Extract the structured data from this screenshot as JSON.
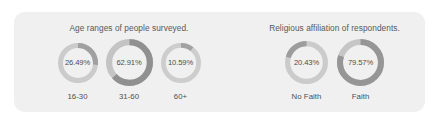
{
  "panel": {
    "background_color": "#f0f0f0",
    "corner_radius": "11px"
  },
  "theme": {
    "arc_color": "#9a9a9a",
    "track_color": "#c9c9c9",
    "title_color": "#585858",
    "label_color": "#4f4f4f",
    "value_color": "#4e4e4e",
    "page_background": "#ffffff"
  },
  "groups": [
    {
      "id": "age-ranges",
      "title": "Age ranges of people surveyed.",
      "gauges": [
        {
          "id": "age-16-30",
          "label": "16-30",
          "value_text": "26.49%",
          "value": 26.49,
          "diameter": 40,
          "thickness": 5.0,
          "start_angle": 0,
          "direction": "clockwise",
          "arc_color": "#a0a0a0",
          "track_color": "#cbcbcb"
        },
        {
          "id": "age-31-60",
          "label": "31-60",
          "value_text": "62.91%",
          "value": 62.91,
          "diameter": 47,
          "thickness": 6.2,
          "start_angle": 0,
          "direction": "clockwise",
          "arc_color": "#909090",
          "track_color": "#c4c4c4"
        },
        {
          "id": "age-60-plus",
          "label": "60+",
          "value_text": "10.59%",
          "value": 10.59,
          "diameter": 40,
          "thickness": 4.8,
          "start_angle": 0,
          "direction": "clockwise",
          "arc_color": "#a2a2a2",
          "track_color": "#cdcdcd"
        }
      ]
    },
    {
      "id": "religious-affiliation",
      "title": "Religious affiliation of respondents.",
      "gauges": [
        {
          "id": "no-faith",
          "label": "No Faith",
          "value_text": "20.43%",
          "value": 20.43,
          "diameter": 43,
          "thickness": 5.2,
          "start_angle": 0,
          "direction": "counter-clockwise",
          "arc_color": "#9d9d9d",
          "track_color": "#cbcbcb"
        },
        {
          "id": "faith",
          "label": "Faith",
          "value_text": "79.57%",
          "value": 79.57,
          "diameter": 47,
          "thickness": 6.0,
          "start_angle": 0,
          "direction": "clockwise",
          "arc_color": "#969696",
          "track_color": "#c6c6c6"
        }
      ]
    }
  ],
  "chart_data": {
    "type": "pie",
    "charts": [
      {
        "type": "pie",
        "subtype": "donut-gauge-set",
        "title": "Age ranges of people surveyed.",
        "categories": [
          "16-30",
          "31-60",
          "60+"
        ],
        "values": [
          26.49,
          62.91,
          10.59
        ],
        "value_labels": [
          "26.49%",
          "62.91%",
          "10.59%"
        ],
        "units": "percent",
        "total": 99.99,
        "xlabel": "",
        "ylabel": "",
        "legend": "none",
        "grid": false
      },
      {
        "type": "pie",
        "subtype": "donut-gauge-set",
        "title": "Religious affiliation of respondents.",
        "categories": [
          "No Faith",
          "Faith"
        ],
        "values": [
          20.43,
          79.57
        ],
        "value_labels": [
          "20.43%",
          "79.57%"
        ],
        "units": "percent",
        "total": 100.0,
        "xlabel": "",
        "ylabel": "",
        "legend": "none",
        "grid": false
      }
    ]
  }
}
